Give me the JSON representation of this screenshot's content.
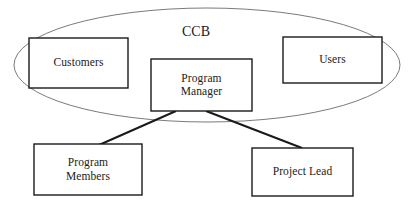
{
  "diagram": {
    "background_color": "#ffffff",
    "stroke_color": "#1a1a1a",
    "ellipse_stroke_color": "#6b6b6b",
    "group": {
      "name": "ccb-group",
      "label": "CCB",
      "shape": "ellipse",
      "label_x": 196,
      "label_y": 32,
      "cx": 207,
      "cy": 65,
      "rx": 193,
      "ry": 57
    },
    "nodes": [
      {
        "id": "customers",
        "label": "Customers",
        "shape": "rect",
        "x": 29,
        "y": 38,
        "width": 99,
        "height": 50,
        "inside_group": true
      },
      {
        "id": "program-manager",
        "label": "Program\nManager",
        "shape": "rect",
        "x": 151,
        "y": 59,
        "width": 101,
        "height": 52,
        "inside_group": true
      },
      {
        "id": "users",
        "label": "Users",
        "shape": "rect",
        "x": 283,
        "y": 37,
        "width": 99,
        "height": 46,
        "inside_group": true
      },
      {
        "id": "program-members",
        "label": "Program\nMembers",
        "shape": "rect",
        "x": 34,
        "y": 144,
        "width": 108,
        "height": 51,
        "inside_group": false
      },
      {
        "id": "project-lead",
        "label": "Project Lead",
        "shape": "rect",
        "x": 252,
        "y": 148,
        "width": 101,
        "height": 48,
        "inside_group": false
      }
    ],
    "connectors": [
      {
        "id": "pm-to-program-members",
        "from": "program-manager",
        "to": "program-members",
        "x1": 176,
        "y1": 111,
        "x2": 99,
        "y2": 145
      },
      {
        "id": "pm-to-project-lead",
        "from": "program-manager",
        "to": "project-lead",
        "x1": 206,
        "y1": 111,
        "x2": 302,
        "y2": 148
      }
    ]
  }
}
